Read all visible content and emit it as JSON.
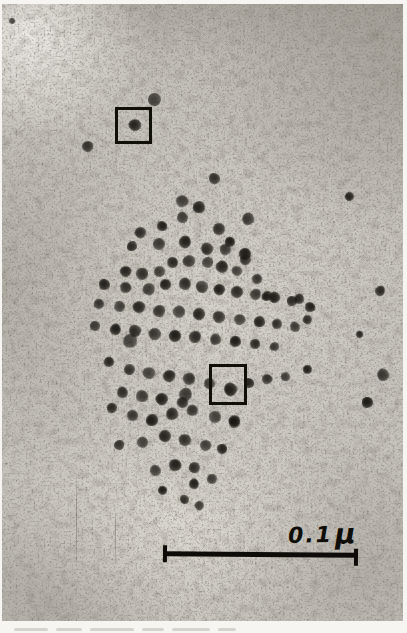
{
  "figure": {
    "kind": "transmission-electron-micrograph",
    "scale_bar": {
      "value": "0.1",
      "unit": "μ",
      "label": "0.1 μ"
    },
    "annotation_boxes": [
      {
        "x": 113,
        "y": 103,
        "w": 37,
        "h": 37
      },
      {
        "x": 207,
        "y": 360,
        "w": 38,
        "h": 41
      }
    ],
    "particles": [
      [
        152,
        95,
        13
      ],
      [
        133,
        121,
        12
      ],
      [
        85,
        142,
        11
      ],
      [
        10,
        17,
        6
      ],
      [
        347,
        192,
        9
      ],
      [
        212,
        174,
        11
      ],
      [
        180,
        197,
        12
      ],
      [
        197,
        203,
        12
      ],
      [
        217,
        225,
        12
      ],
      [
        180,
        213,
        11
      ],
      [
        160,
        222,
        10
      ],
      [
        138,
        228,
        11
      ],
      [
        157,
        240,
        12
      ],
      [
        183,
        238,
        12
      ],
      [
        205,
        245,
        12
      ],
      [
        223,
        245,
        11
      ],
      [
        243,
        250,
        12
      ],
      [
        130,
        242,
        10
      ],
      [
        246,
        215,
        12
      ],
      [
        228,
        238,
        10
      ],
      [
        170,
        258,
        11
      ],
      [
        187,
        257,
        12
      ],
      [
        205,
        258,
        11
      ],
      [
        220,
        263,
        12
      ],
      [
        243,
        255,
        11
      ],
      [
        235,
        267,
        10
      ],
      [
        123,
        267,
        11
      ],
      [
        140,
        270,
        12
      ],
      [
        157,
        267,
        11
      ],
      [
        102,
        280,
        11
      ],
      [
        123,
        283,
        11
      ],
      [
        147,
        285,
        12
      ],
      [
        163,
        280,
        11
      ],
      [
        183,
        280,
        12
      ],
      [
        200,
        283,
        12
      ],
      [
        217,
        285,
        11
      ],
      [
        235,
        288,
        12
      ],
      [
        253,
        290,
        11
      ],
      [
        272,
        293,
        11
      ],
      [
        290,
        297,
        10
      ],
      [
        255,
        275,
        10
      ],
      [
        265,
        292,
        10
      ],
      [
        297,
        295,
        10
      ],
      [
        97,
        300,
        10
      ],
      [
        117,
        302,
        11
      ],
      [
        137,
        303,
        12
      ],
      [
        157,
        307,
        12
      ],
      [
        177,
        308,
        12
      ],
      [
        197,
        310,
        12
      ],
      [
        217,
        313,
        12
      ],
      [
        237,
        315,
        11
      ],
      [
        257,
        317,
        11
      ],
      [
        275,
        320,
        10
      ],
      [
        293,
        323,
        10
      ],
      [
        308,
        303,
        10
      ],
      [
        305,
        315,
        9
      ],
      [
        93,
        322,
        10
      ],
      [
        113,
        325,
        11
      ],
      [
        133,
        327,
        12
      ],
      [
        153,
        330,
        12
      ],
      [
        173,
        332,
        12
      ],
      [
        193,
        333,
        12
      ],
      [
        213,
        335,
        11
      ],
      [
        233,
        337,
        11
      ],
      [
        253,
        340,
        10
      ],
      [
        272,
        342,
        9
      ],
      [
        128,
        337,
        14
      ],
      [
        107,
        358,
        10
      ],
      [
        127,
        365,
        11
      ],
      [
        147,
        369,
        12
      ],
      [
        167,
        372,
        12
      ],
      [
        187,
        375,
        12
      ],
      [
        207,
        379,
        11
      ],
      [
        247,
        379,
        10
      ],
      [
        265,
        375,
        10
      ],
      [
        283,
        372,
        9
      ],
      [
        305,
        365,
        9
      ],
      [
        120,
        388,
        11
      ],
      [
        140,
        392,
        12
      ],
      [
        160,
        395,
        12
      ],
      [
        180,
        398,
        11
      ],
      [
        183,
        390,
        13
      ],
      [
        228,
        385,
        13
      ],
      [
        110,
        404,
        10
      ],
      [
        130,
        411,
        11
      ],
      [
        150,
        416,
        12
      ],
      [
        170,
        410,
        12
      ],
      [
        190,
        406,
        11
      ],
      [
        213,
        413,
        12
      ],
      [
        232,
        416,
        11
      ],
      [
        117,
        441,
        10
      ],
      [
        140,
        438,
        11
      ],
      [
        163,
        432,
        12
      ],
      [
        183,
        436,
        12
      ],
      [
        203,
        441,
        11
      ],
      [
        220,
        445,
        10
      ],
      [
        232,
        418,
        11
      ],
      [
        153,
        466,
        11
      ],
      [
        173,
        461,
        12
      ],
      [
        192,
        463,
        11
      ],
      [
        210,
        475,
        10
      ],
      [
        192,
        480,
        10
      ],
      [
        182,
        495,
        9
      ],
      [
        197,
        501,
        9
      ],
      [
        160,
        486,
        9
      ],
      [
        378,
        287,
        10
      ],
      [
        381,
        371,
        12
      ],
      [
        365,
        398,
        11
      ],
      [
        357,
        330,
        7
      ]
    ],
    "scratches": [
      {
        "x": 74,
        "y": 468,
        "h": 100
      },
      {
        "x": 113,
        "y": 503,
        "h": 60
      }
    ],
    "caption_smudges": [
      {
        "x": 14,
        "w": 34
      },
      {
        "x": 56,
        "w": 26
      },
      {
        "x": 90,
        "w": 44
      },
      {
        "x": 142,
        "w": 22
      },
      {
        "x": 172,
        "w": 38
      },
      {
        "x": 218,
        "w": 18
      }
    ],
    "colors": {
      "paper": "#f6f5f1",
      "photo_base": "#c7c4bd",
      "grain_dark": "#2e2b26",
      "particle": "#221f1a",
      "ink": "#0d0c08"
    }
  }
}
